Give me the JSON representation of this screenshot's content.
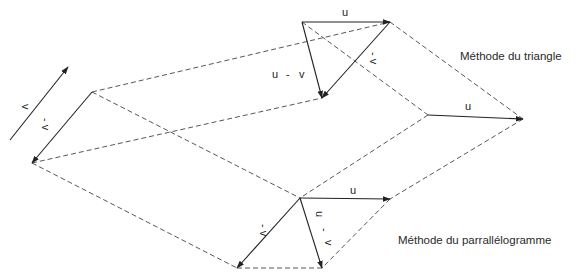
{
  "captions": {
    "triangle": "Méthode du triangle",
    "parallelogram": "Méthode du parrallélogramme"
  },
  "labels": {
    "u": "u",
    "v": "v",
    "minus_v": "- v",
    "u_minus_v_u": "u",
    "u_minus_v_minus": "-",
    "u_minus_v_v": "v"
  },
  "colors": {
    "line": "#222222",
    "dash": "#444444",
    "background": "#ffffff"
  }
}
